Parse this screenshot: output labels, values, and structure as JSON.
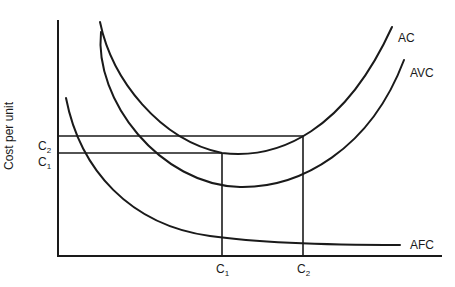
{
  "diagram": {
    "title": "",
    "y_axis_label": "Cost per unit",
    "x_axis_label": "",
    "curves": [
      {
        "name": "AC",
        "label": "AC"
      },
      {
        "name": "AVC",
        "label": "AVC"
      },
      {
        "name": "AFC",
        "label": "AFC"
      }
    ],
    "y_ticks": [
      {
        "base": "C",
        "sub": "2"
      },
      {
        "base": "C",
        "sub": "1"
      }
    ],
    "x_ticks": [
      {
        "base": "C",
        "sub": "1"
      },
      {
        "base": "C",
        "sub": "2"
      }
    ],
    "colors": {
      "ink": "#1a1a1a",
      "background": "#ffffff"
    }
  }
}
